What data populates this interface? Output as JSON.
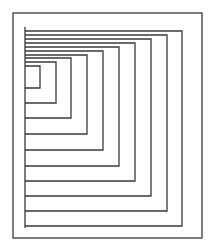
{
  "figure": {
    "type": "nested-rectangles-line-drawing",
    "background": "#ffffff",
    "stroke_color": "#3a3a3a",
    "outer_frame": {
      "x1": 13,
      "y1": 13,
      "x2": 202,
      "y2": 238
    },
    "spine": {
      "x": 25,
      "y1": 27,
      "y2": 228
    },
    "nested_rects": [
      {
        "right": 40,
        "top": 66,
        "bottom": 88
      },
      {
        "right": 56,
        "top": 62,
        "bottom": 103
      },
      {
        "right": 71,
        "top": 58,
        "bottom": 118
      },
      {
        "right": 87,
        "top": 55,
        "bottom": 134
      },
      {
        "right": 103,
        "top": 51,
        "bottom": 150
      },
      {
        "right": 119,
        "top": 47,
        "bottom": 166
      },
      {
        "right": 135,
        "top": 43,
        "bottom": 181
      },
      {
        "right": 151,
        "top": 39,
        "bottom": 196
      },
      {
        "right": 167,
        "top": 35,
        "bottom": 211
      },
      {
        "right": 182,
        "top": 31,
        "bottom": 226
      }
    ]
  }
}
